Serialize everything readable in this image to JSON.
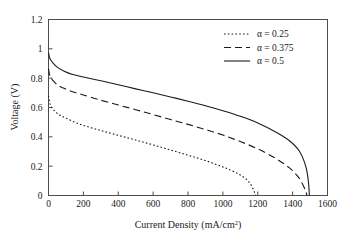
{
  "chart_data": {
    "type": "line",
    "title": "",
    "xlabel": "Current Density (mA/cm2)",
    "xlabel_base": "Current Density (mA/cm",
    "xlabel_sup": "2",
    "xlabel_tail": ")",
    "ylabel": "Voltage (V)",
    "xlim": [
      0,
      1600
    ],
    "ylim": [
      0,
      1.2
    ],
    "xticks": [
      0,
      200,
      400,
      600,
      800,
      1000,
      1200,
      1400,
      1600
    ],
    "xtick_labels": [
      "0",
      "200",
      "400",
      "600",
      "800",
      "1000",
      "1200",
      "1400",
      "1600"
    ],
    "yticks": [
      0,
      0.2,
      0.4,
      0.6,
      0.8,
      1,
      1.2
    ],
    "ytick_labels": [
      "0",
      "0.2",
      "0.4",
      "0.6",
      "0.8",
      "1",
      "1.2"
    ],
    "grid": false,
    "legend_position": "top-right",
    "series": [
      {
        "name": "alpha = 0.25",
        "label": "α = 0.25",
        "style": "dotted",
        "color": "#1a1a1a",
        "x": [
          0,
          5,
          12,
          25,
          45,
          70,
          100,
          150,
          200,
          300,
          400,
          500,
          600,
          700,
          800,
          900,
          1000,
          1050,
          1100,
          1140,
          1165,
          1180,
          1188
        ],
        "y": [
          0.68,
          0.645,
          0.615,
          0.59,
          0.565,
          0.545,
          0.528,
          0.5,
          0.478,
          0.443,
          0.41,
          0.378,
          0.345,
          0.31,
          0.275,
          0.238,
          0.195,
          0.17,
          0.14,
          0.105,
          0.065,
          0.025,
          0.0
        ]
      },
      {
        "name": "alpha = 0.375",
        "label": "α = 0.375",
        "style": "dashed",
        "color": "#1a1a1a",
        "x": [
          0,
          5,
          12,
          25,
          50,
          80,
          120,
          200,
          300,
          400,
          500,
          600,
          700,
          800,
          900,
          1000,
          1100,
          1200,
          1300,
          1380,
          1430,
          1460,
          1475,
          1482
        ],
        "y": [
          0.865,
          0.83,
          0.805,
          0.785,
          0.755,
          0.735,
          0.715,
          0.685,
          0.65,
          0.617,
          0.585,
          0.552,
          0.518,
          0.485,
          0.45,
          0.412,
          0.368,
          0.318,
          0.255,
          0.19,
          0.13,
          0.07,
          0.03,
          0.0
        ]
      },
      {
        "name": "alpha = 0.5",
        "label": "α = 0.5",
        "style": "solid",
        "color": "#1a1a1a",
        "x": [
          0,
          5,
          12,
          25,
          50,
          90,
          140,
          200,
          300,
          400,
          500,
          600,
          700,
          800,
          900,
          1000,
          1100,
          1200,
          1300,
          1380,
          1440,
          1475,
          1490,
          1496
        ],
        "y": [
          0.975,
          0.945,
          0.925,
          0.905,
          0.875,
          0.848,
          0.825,
          0.808,
          0.782,
          0.755,
          0.727,
          0.7,
          0.672,
          0.643,
          0.612,
          0.578,
          0.54,
          0.495,
          0.435,
          0.375,
          0.3,
          0.2,
          0.1,
          0.0
        ]
      }
    ]
  }
}
